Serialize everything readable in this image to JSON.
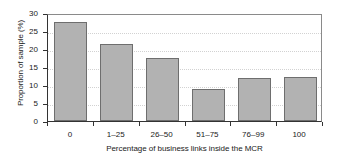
{
  "chart_data": {
    "type": "bar",
    "title": "",
    "subtitle": "",
    "categories": [
      "0",
      "1–25",
      "26–50",
      "51–75",
      "76–99",
      "100"
    ],
    "values": [
      27.5,
      21.5,
      17.4,
      9.0,
      12.0,
      12.1
    ],
    "xlabel": "Percentage of business links inside the MCR",
    "ylabel": "Proportion of sample (%)",
    "ylim": [
      0,
      30
    ],
    "yticks": [
      0,
      5,
      10,
      15,
      20,
      25,
      30
    ],
    "ytick_labels": [
      "0",
      "5",
      "10",
      "15",
      "20",
      "25",
      "30"
    ],
    "grid": true,
    "grid_axis": "y",
    "legend": false,
    "legend_position": "none",
    "bar_color": "#b2b2b2",
    "bar_edge_color": "#6e6e6e",
    "axis_color": "#333333",
    "grid_color": "#d2d2d2",
    "background_color": "#ffffff"
  }
}
